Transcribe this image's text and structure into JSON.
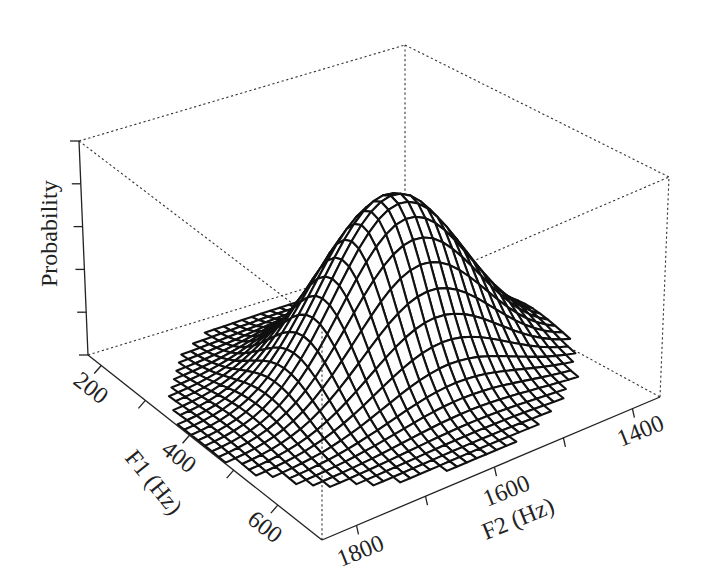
{
  "chart_data": {
    "type": "surface-3d",
    "title": "",
    "x_axis": {
      "label": "F1 (Hz)",
      "ticks": [
        200,
        300,
        400,
        500,
        600
      ],
      "tick_labels": [
        "200",
        "400",
        "600"
      ],
      "range": [
        170,
        700
      ]
    },
    "y_axis": {
      "label": "F2 (Hz)",
      "ticks": [
        1400,
        1500,
        1600,
        1700,
        1800
      ],
      "tick_labels": [
        "1400",
        "1600",
        "1800"
      ],
      "range": [
        1360,
        1850
      ]
    },
    "z_axis": {
      "label": "Probability",
      "ticks_count": 6,
      "tick_labels": []
    },
    "peak": {
      "F1": 420,
      "F2": 1560,
      "relative_height": 0.82
    },
    "spread": {
      "F1_sd": 75,
      "F2_sd": 95
    },
    "box": "dotted",
    "grid": false
  },
  "labels": {
    "z_axis": "Probability",
    "x_axis": "F1 (Hz)",
    "y_axis": "F2 (Hz)",
    "x_ticks": [
      "200",
      "400",
      "600"
    ],
    "y_ticks": [
      "1400",
      "1600",
      "1800"
    ]
  }
}
